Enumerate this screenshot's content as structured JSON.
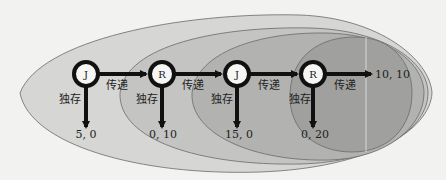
{
  "diagram": {
    "type": "game-tree-centipede",
    "colors": {
      "background": "#f2f2f0",
      "ellipse_1": "#d6d6d4",
      "ellipse_2": "#c4c4c2",
      "ellipse_3": "#b2b2b0",
      "ellipse_4": "#a0a09e",
      "ellipse_stroke": "#6a6a6a",
      "arrow": "#111111",
      "node_fill": "#f6f6f4",
      "node_ring": "#111111"
    },
    "nodes": [
      {
        "label": "J",
        "cx": 86,
        "cy": 74
      },
      {
        "label": "R",
        "cx": 162,
        "cy": 74
      },
      {
        "label": "J",
        "cx": 237,
        "cy": 74
      },
      {
        "label": "R",
        "cx": 313,
        "cy": 74
      }
    ],
    "pass_label": "传递",
    "keep_label": "独存",
    "pass_labels": [
      "传递",
      "传递",
      "传递",
      "传递"
    ],
    "keep_labels": [
      "独存",
      "独存",
      "独存",
      "独存"
    ],
    "payoffs": [
      "5, 0",
      "0, 10",
      "15, 0",
      "0, 20"
    ],
    "final_payoff": "10, 10"
  }
}
